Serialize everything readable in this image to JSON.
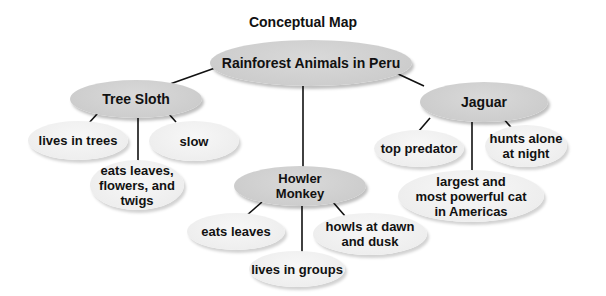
{
  "title": "Conceptual Map",
  "colors": {
    "main_node_fill": "#cdcdcd",
    "leaf_node_fill": "#eeeeee",
    "line": "#111111",
    "background": "#ffffff"
  },
  "root": {
    "label": "Rainforest Animals in Peru"
  },
  "animals": [
    {
      "label": "Tree Sloth",
      "facts": [
        "lives in trees",
        "eats leaves,\nflowers, and\ntwigs",
        "slow"
      ]
    },
    {
      "label": "Howler\nMonkey",
      "facts": [
        "eats leaves",
        "lives in groups",
        "howls at dawn\nand dusk"
      ]
    },
    {
      "label": "Jaguar",
      "facts": [
        "top predator",
        "largest and\nmost powerful cat\nin  Americas",
        "hunts alone\nat night"
      ]
    }
  ]
}
